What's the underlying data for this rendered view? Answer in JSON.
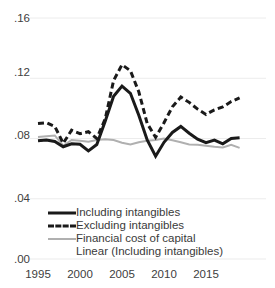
{
  "chart_data": {
    "type": "line",
    "title": "",
    "subtitle": "",
    "xlabel": "",
    "ylabel": "",
    "xlim": [
      1995,
      2019
    ],
    "ylim": [
      0.0,
      0.16
    ],
    "grid": true,
    "grid_axis": "y",
    "legend_position": "inside-bottom-left",
    "x": [
      1995,
      1996,
      1997,
      1998,
      1999,
      2000,
      2001,
      2002,
      2003,
      2004,
      2005,
      2006,
      2007,
      2008,
      2009,
      2010,
      2011,
      2012,
      2013,
      2014,
      2015,
      2016,
      2017,
      2018,
      2019
    ],
    "xticks": [
      1995,
      2000,
      2005,
      2010,
      2015
    ],
    "xtick_labels": [
      "1995",
      "2000",
      "2005",
      "2010",
      "2015"
    ],
    "yticks": [
      0.0,
      0.04,
      0.08,
      0.12,
      0.16
    ],
    "ytick_labels": [
      ".00",
      ".04",
      ".08",
      ".12",
      ".16"
    ],
    "series": [
      {
        "name": "Including intangibles",
        "style": "solid",
        "color": "#1a1a1a",
        "width": 3,
        "values": [
          0.0785,
          0.079,
          0.078,
          0.0745,
          0.0765,
          0.0762,
          0.0718,
          0.076,
          0.0915,
          0.108,
          0.1148,
          0.11,
          0.0955,
          0.079,
          0.0682,
          0.0775,
          0.084,
          0.088,
          0.0835,
          0.0795,
          0.0772,
          0.079,
          0.0765,
          0.08,
          0.0805
        ]
      },
      {
        "name": "Excluding intangibles",
        "style": "dashed",
        "color": "#1a1a1a",
        "width": 3,
        "values": [
          0.09,
          0.0905,
          0.088,
          0.0768,
          0.0855,
          0.0832,
          0.0845,
          0.08,
          0.093,
          0.1185,
          0.129,
          0.125,
          0.111,
          0.09,
          0.0808,
          0.0905,
          0.101,
          0.1075,
          0.104,
          0.0995,
          0.096,
          0.099,
          0.101,
          0.1045,
          0.107
        ]
      },
      {
        "name": "Financial cost of capital",
        "style": "solid",
        "color": "#b0b0b0",
        "width": 2,
        "values": [
          0.081,
          0.0815,
          0.082,
          0.0752,
          0.079,
          0.0785,
          0.0778,
          0.079,
          0.0795,
          0.079,
          0.0772,
          0.076,
          0.0775,
          0.0785,
          0.079,
          0.08,
          0.0788,
          0.0775,
          0.076,
          0.0758,
          0.0752,
          0.0745,
          0.074,
          0.0758,
          0.0738
        ]
      }
    ],
    "legend_entries": [
      {
        "label": "Including intangibles",
        "style": "solid",
        "color": "#1a1a1a"
      },
      {
        "label": "Excluding intangibles",
        "style": "dashed",
        "color": "#1a1a1a"
      },
      {
        "label": "Financial cost of capital",
        "style": "gray",
        "color": "#b0b0b0"
      },
      {
        "label": "Linear (Including intangibles)",
        "style": "none",
        "color": "#1a1a1a"
      }
    ]
  },
  "axes": {
    "y_labels": [
      ".16",
      ".12",
      ".08",
      ".04",
      ".00"
    ],
    "x_labels": [
      "1995",
      "2000",
      "2005",
      "2010",
      "2015"
    ]
  },
  "colors": {
    "gridline": "#ececec",
    "series_dark": "#1a1a1a",
    "series_gray": "#b0b0b0",
    "text": "#3a3a3a",
    "background": "#ffffff"
  }
}
